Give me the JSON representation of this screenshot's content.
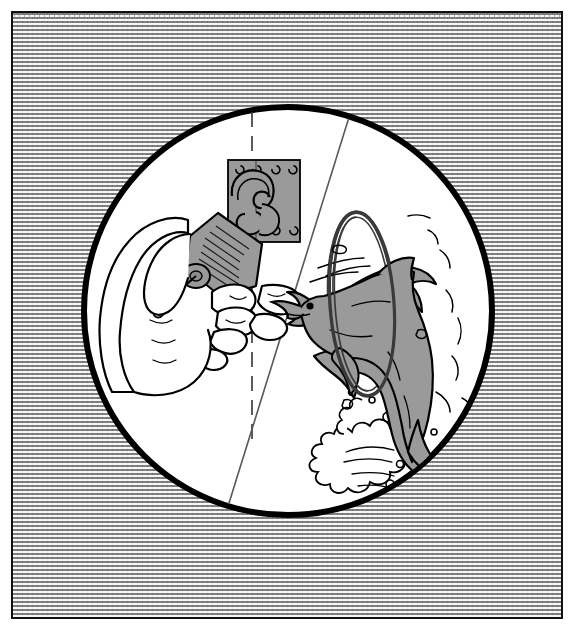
{
  "scene": {
    "title": "Padlock and key beside dolphin jumping through hoop",
    "description": "A framed illustration with a stippled gray background. A large white circle contains two halves separated by a diagonal line: on the left a hand holds a padlock against a hasp plate while inserting a key; on the right a dolphin leaps through a hoop above a water splash.",
    "frame": {
      "border_color": "#111111",
      "background_texture": "stipple-brick-weave",
      "texture_gray": "#9d9d9d",
      "texture_highlight": "#f2f2f2",
      "margin_color": "#ffffff"
    },
    "circle": {
      "name": "main-illustration-circle",
      "center_x": 288,
      "center_y": 311,
      "radius": 205,
      "fill": "#ffffff",
      "stroke": "#000000",
      "stroke_width": 6
    },
    "divider_line": {
      "name": "diagonal-divider",
      "x1": 350,
      "y1": 116,
      "x2": 226,
      "y2": 514,
      "stroke": "#555555",
      "stroke_width": 1.6,
      "style": "solid"
    },
    "dashed_line": {
      "name": "vertical-dashed-guide",
      "x1": 252,
      "y1": 112,
      "x2": 252,
      "y2": 440,
      "stroke": "#444444",
      "stroke_width": 1.6,
      "style": "dashed",
      "dash_pattern": "14 8"
    },
    "left_half": {
      "name": "padlock-and-hand-scene",
      "items": [
        {
          "name": "hasp-plate",
          "fill": "#9a9a9a",
          "stroke": "#000000",
          "screws": 6
        },
        {
          "name": "padlock-body",
          "fill": "#9a9a9a",
          "stroke": "#000000"
        },
        {
          "name": "padlock-shackle",
          "fill": "#9a9a9a",
          "stroke": "#000000"
        },
        {
          "name": "hand",
          "fill": "#ffffff",
          "stroke": "#000000"
        },
        {
          "name": "key",
          "fill": "#ffffff",
          "stroke": "#000000"
        }
      ]
    },
    "right_half": {
      "name": "dolphin-and-hoop-scene",
      "items": [
        {
          "name": "hoop-ring",
          "fill": "none",
          "stroke": "#3a3a3a",
          "stroke_width": 3
        },
        {
          "name": "dolphin-body",
          "fill": "#9a9a9a",
          "stroke": "#000000"
        },
        {
          "name": "dolphin-eye",
          "fill": "#000000"
        },
        {
          "name": "water-splash",
          "fill": "#ffffff",
          "stroke": "#000000"
        },
        {
          "name": "water-bubbles",
          "count": 9,
          "stroke": "#000000"
        }
      ]
    },
    "palette": {
      "ink": "#000000",
      "gray_fill": "#9a9a9a",
      "paper": "#ffffff",
      "texture_gray": "#9d9d9d",
      "divider_gray": "#555555"
    }
  }
}
